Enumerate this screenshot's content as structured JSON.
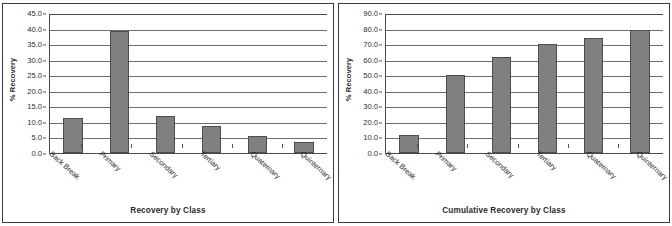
{
  "figure": {
    "background": "#ffffff",
    "border_color": "#3a3a3a",
    "bar_fill": "#808080",
    "bar_stroke": "#4d4d4d",
    "gridline_color": "#6e6e6e",
    "axis_color": "#4a4a4a"
  },
  "chart_data": [
    {
      "type": "bar",
      "title": "",
      "xlabel": "Recovery by Class",
      "ylabel": "% Recovery",
      "categories": [
        "Back Break",
        "Primary",
        "Secondary",
        "Tertiary",
        "Quaternary",
        "Quinternary"
      ],
      "values": [
        11.2,
        39.1,
        11.9,
        8.8,
        5.6,
        3.7
      ],
      "ylim": [
        0.0,
        45.0
      ],
      "yticks": [
        "0.0",
        "5.0",
        "10.0",
        "15.0",
        "20.0",
        "25.0",
        "30.0",
        "35.0",
        "40.0",
        "45.0"
      ],
      "ytick_values": [
        0.0,
        5.0,
        10.0,
        15.0,
        20.0,
        25.0,
        30.0,
        35.0,
        40.0,
        45.0
      ],
      "grid": true,
      "legend": "none"
    },
    {
      "type": "bar",
      "title": "",
      "xlabel": "Cumulative Recovery by Class",
      "ylabel": "% Recovery",
      "categories": [
        "Back Break",
        "Primary",
        "Secondary",
        "Tertiary",
        "Quaternary",
        "Quinternary"
      ],
      "values": [
        11.8,
        50.0,
        62.0,
        70.0,
        73.8,
        78.9
      ],
      "ylim": [
        0.0,
        90.0
      ],
      "yticks": [
        "0.0",
        "10.0",
        "20.0",
        "30.0",
        "40.0",
        "50.0",
        "60.0",
        "70.0",
        "80.0",
        "90.0"
      ],
      "ytick_values": [
        0.0,
        10.0,
        20.0,
        30.0,
        40.0,
        50.0,
        60.0,
        70.0,
        80.0,
        90.0
      ],
      "grid": true,
      "legend": "none"
    }
  ]
}
